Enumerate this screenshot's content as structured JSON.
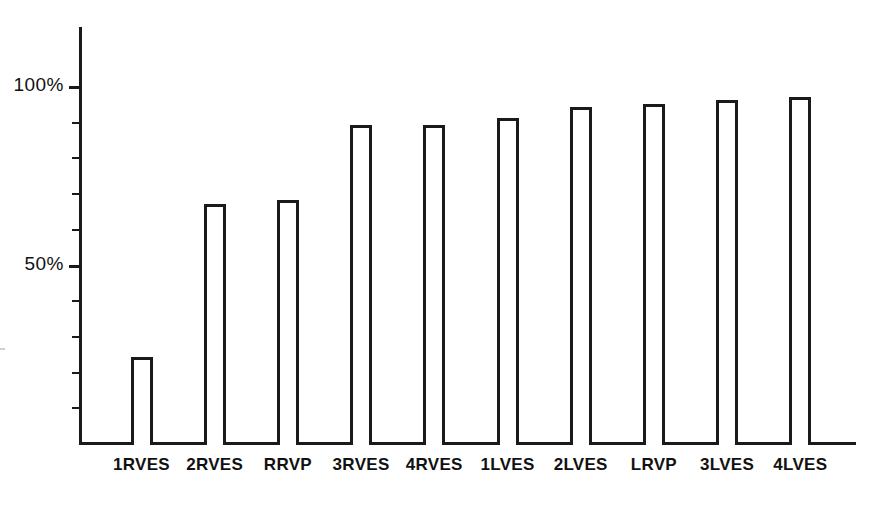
{
  "chart_data": {
    "type": "bar",
    "title": "",
    "subtitle": "",
    "xlabel": "",
    "ylabel": "",
    "categories": [
      "1RVES",
      "2RVES",
      "RRVP",
      "3RVES",
      "4RVES",
      "1LVES",
      "2LVES",
      "LRVP",
      "3LVES",
      "4LVES"
    ],
    "values": [
      24,
      67,
      68,
      89,
      89,
      91,
      94,
      95,
      96,
      97
    ],
    "unit": "%",
    "ylim": [
      0,
      110
    ],
    "ytick_labels": [
      "50%",
      "100%"
    ],
    "ytick_values": [
      50,
      100
    ],
    "minor_tick_values": [
      10,
      20,
      30,
      40,
      60,
      70,
      80,
      90
    ],
    "grid": false,
    "legend": null,
    "legend_position": "none",
    "bar_style": "outline",
    "colors": {
      "bar_outline": "#1a1a1a",
      "bar_fill": "#ffffff",
      "axis": "#1a1a1a",
      "text": "#111111",
      "background": "#ffffff"
    }
  },
  "axis": {
    "y_labels": [
      {
        "text": "100%",
        "value": 100
      },
      {
        "text": "50%",
        "value": 50
      }
    ]
  },
  "bars": [
    {
      "label": "1RVES",
      "value": 24
    },
    {
      "label": "2RVES",
      "value": 67
    },
    {
      "label": "RRVP",
      "value": 68
    },
    {
      "label": "3RVES",
      "value": 89
    },
    {
      "label": "4RVES",
      "value": 89
    },
    {
      "label": "1LVES",
      "value": 91
    },
    {
      "label": "2LVES",
      "value": 94
    },
    {
      "label": "LRVP",
      "value": 95
    },
    {
      "label": "3LVES",
      "value": 96
    },
    {
      "label": "4LVES",
      "value": 97
    }
  ]
}
